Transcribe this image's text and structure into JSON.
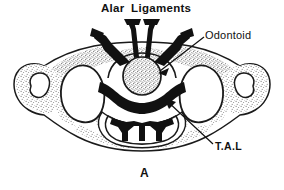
{
  "figure": {
    "panel_letter": "A",
    "background_color": "#ffffff",
    "ink_color": "#111111",
    "stipple_color": "#7b7b7b"
  },
  "labels": {
    "alar_ligaments": "Alar Ligaments",
    "odontoid": "Odontoid",
    "tal": "T.A.L"
  },
  "structures": [
    {
      "name": "alar-ligaments",
      "fill": "#111111",
      "description": "paired black wedge bands radiating superolaterally from the odontoid apex"
    },
    {
      "name": "odontoid-process",
      "fill": "#b9b9b9",
      "description": "stippled round dens seated in the anterior arch"
    },
    {
      "name": "transverse-atlantal-ligament",
      "fill": "#111111",
      "description": "thick black band crossing behind the odontoid"
    },
    {
      "name": "lateral-mass-left",
      "fill": "#ffffff",
      "description": "left superior articular facet outline"
    },
    {
      "name": "lateral-mass-right",
      "fill": "#ffffff",
      "description": "right superior articular facet outline"
    },
    {
      "name": "transverse-foramen-left",
      "fill": "#ffffff",
      "description": "small oval opening in left transverse process"
    },
    {
      "name": "transverse-foramen-right",
      "fill": "#ffffff",
      "description": "small oval opening in right transverse process"
    },
    {
      "name": "spinal-cord",
      "fill": "#ffffff",
      "description": "cord cross-section with butterfly-shaped black grey matter"
    },
    {
      "name": "vertebral-body-outline",
      "fill": "#ffffff",
      "description": "overall winged silhouette of the atlas"
    }
  ],
  "leaders": [
    {
      "name": "odontoid-leader",
      "from": "Odontoid label",
      "to": "odontoid-process",
      "arrow": true
    },
    {
      "name": "tal-leader",
      "from": "T.A.L label",
      "to": "transverse-atlantal-ligament",
      "arrow": true
    }
  ]
}
